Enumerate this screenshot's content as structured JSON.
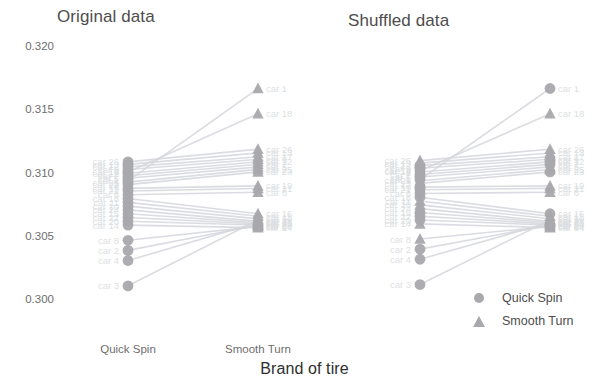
{
  "panels": [
    {
      "title": "Original data"
    },
    {
      "title": "Shuffled data"
    }
  ],
  "axis": {
    "y_title": "",
    "x_title": "Brand of tire",
    "y_ticks": [
      "0.320",
      "0.315",
      "0.310",
      "0.305",
      "0.300"
    ],
    "x_ticks": [
      "Quick Spin",
      "Smooth Turn"
    ]
  },
  "legend": {
    "items": [
      {
        "label": "Quick Spin",
        "marker": "circle-icon",
        "color": "#a9a9ad"
      },
      {
        "label": "Smooth Turn",
        "marker": "triangle-icon",
        "color": "#a9a9ad"
      }
    ]
  },
  "chart_data": {
    "type": "line",
    "xlabel": "Brand of tire",
    "ylabel": "",
    "ylim": [
      0.3,
      0.32
    ],
    "xcategories": [
      "Quick Spin",
      "Smooth Turn"
    ],
    "grid": false,
    "legend_position": "bottom-right",
    "marker_color": "#a9a9ad",
    "line_color": "#d5d7dc",
    "label_color": "#dddfe3",
    "panels": [
      {
        "name": "Original data",
        "series": [
          {
            "name": "car 1",
            "values": [
              0.3095,
              0.3168
            ]
          },
          {
            "name": "car 18",
            "values": [
              0.3102,
              0.3148
            ]
          },
          {
            "name": "car 26",
            "values": [
              0.311,
              0.312
            ]
          },
          {
            "name": "car 13",
            "values": [
              0.3108,
              0.3117
            ]
          },
          {
            "name": "car 17",
            "values": [
              0.3106,
              0.3114
            ]
          },
          {
            "name": "car 9",
            "values": [
              0.3104,
              0.3112
            ]
          },
          {
            "name": "car 12",
            "values": [
              0.3101,
              0.311
            ]
          },
          {
            "name": "car 7",
            "values": [
              0.3099,
              0.3108
            ]
          },
          {
            "name": "car 5",
            "values": [
              0.3097,
              0.3106
            ]
          },
          {
            "name": "car 25",
            "values": [
              0.3094,
              0.3104
            ]
          },
          {
            "name": "car 23",
            "values": [
              0.3092,
              0.3102
            ]
          },
          {
            "name": "car 19",
            "values": [
              0.3089,
              0.3091
            ]
          },
          {
            "name": "car 21",
            "values": [
              0.3087,
              0.3089
            ]
          },
          {
            "name": "car 6",
            "values": [
              0.3084,
              0.3086
            ]
          },
          {
            "name": "car 16",
            "values": [
              0.3081,
              0.3069
            ]
          },
          {
            "name": "car 11",
            "values": [
              0.3078,
              0.3067
            ]
          },
          {
            "name": "car 10",
            "values": [
              0.3075,
              0.3065
            ]
          },
          {
            "name": "car 24",
            "values": [
              0.3072,
              0.3063
            ]
          },
          {
            "name": "car 15",
            "values": [
              0.3069,
              0.3062
            ]
          },
          {
            "name": "car 22",
            "values": [
              0.3066,
              0.3061
            ]
          },
          {
            "name": "car 20",
            "values": [
              0.3063,
              0.306
            ]
          },
          {
            "name": "car 14",
            "values": [
              0.306,
              0.3058
            ]
          },
          {
            "name": "car 8",
            "values": [
              0.3048,
              0.3059
            ]
          },
          {
            "name": "car 2",
            "values": [
              0.304,
              0.306
            ]
          },
          {
            "name": "car 4",
            "values": [
              0.3032,
              0.3062
            ]
          },
          {
            "name": "car 3",
            "values": [
              0.3012,
              0.3064
            ]
          }
        ]
      },
      {
        "name": "Shuffled data",
        "series": [
          {
            "name": "car 1",
            "values": [
              0.3096,
              0.3168
            ]
          },
          {
            "name": "car 18",
            "values": [
              0.3103,
              0.3148
            ]
          },
          {
            "name": "car 26",
            "values": [
              0.3111,
              0.312
            ]
          },
          {
            "name": "car 13",
            "values": [
              0.3109,
              0.3117
            ]
          },
          {
            "name": "car 17",
            "values": [
              0.3107,
              0.3114
            ]
          },
          {
            "name": "car 9",
            "values": [
              0.3105,
              0.3112
            ]
          },
          {
            "name": "car 12",
            "values": [
              0.3102,
              0.311
            ]
          },
          {
            "name": "car 7",
            "values": [
              0.31,
              0.3108
            ]
          },
          {
            "name": "car 5",
            "values": [
              0.3098,
              0.3106
            ]
          },
          {
            "name": "car 25",
            "values": [
              0.3095,
              0.3104
            ]
          },
          {
            "name": "car 23",
            "values": [
              0.3093,
              0.3102
            ]
          },
          {
            "name": "car 19",
            "values": [
              0.309,
              0.3091
            ]
          },
          {
            "name": "car 21",
            "values": [
              0.3088,
              0.3089
            ]
          },
          {
            "name": "car 6",
            "values": [
              0.3085,
              0.3086
            ]
          },
          {
            "name": "car 16",
            "values": [
              0.3082,
              0.3069
            ]
          },
          {
            "name": "car 11",
            "values": [
              0.3079,
              0.3067
            ]
          },
          {
            "name": "car 10",
            "values": [
              0.3076,
              0.3065
            ]
          },
          {
            "name": "car 24",
            "values": [
              0.3073,
              0.3063
            ]
          },
          {
            "name": "car 15",
            "values": [
              0.307,
              0.3062
            ]
          },
          {
            "name": "car 22",
            "values": [
              0.3067,
              0.3061
            ]
          },
          {
            "name": "car 20",
            "values": [
              0.3064,
              0.306
            ]
          },
          {
            "name": "car 14",
            "values": [
              0.3061,
              0.3058
            ]
          },
          {
            "name": "car 8",
            "values": [
              0.3049,
              0.3059
            ]
          },
          {
            "name": "car 2",
            "values": [
              0.3041,
              0.306
            ]
          },
          {
            "name": "car 4",
            "values": [
              0.3033,
              0.3062
            ]
          },
          {
            "name": "car 3",
            "values": [
              0.3013,
              0.3064
            ]
          }
        ]
      }
    ]
  }
}
